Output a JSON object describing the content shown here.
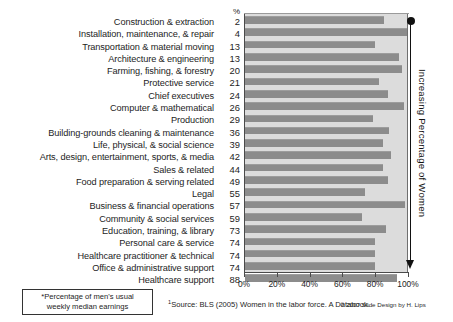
{
  "chart_data": {
    "type": "bar",
    "orientation": "horizontal",
    "title": "",
    "xlabel": "",
    "ylabel": "",
    "xlim": [
      0,
      100
    ],
    "grid": false,
    "legend": null,
    "pct_column_header": "%",
    "categories": [
      "Construction & extraction",
      "Installation, maintenance, & repair",
      "Transportation & material moving",
      "Architecture & engineering",
      "Farming, fishing, & forestry",
      "Protective service",
      "Chief executives",
      "Computer & mathematical",
      "Production",
      "Building-grounds cleaning & maintenance",
      "Life, physical, & social science",
      "Arts, design, entertainment, sports, & media",
      "Sales & related",
      "Food preparation & serving related",
      "Legal",
      "Business & financial operations",
      "Community & social services",
      "Education, training, & library",
      "Personal care & service",
      "Healthcare practitioner & technical",
      "Office & administrative support",
      "Healthcare support"
    ],
    "percent_women": [
      2,
      4,
      13,
      13,
      20,
      21,
      24,
      26,
      29,
      36,
      39,
      42,
      44,
      49,
      55,
      57,
      59,
      73,
      74,
      74,
      74,
      88
    ],
    "values": [
      86,
      100,
      80,
      95,
      97,
      83,
      88,
      98,
      79,
      89,
      85,
      90,
      85,
      88,
      74,
      99,
      72,
      87,
      80,
      80,
      80,
      94
    ],
    "xticks": [
      0,
      20,
      40,
      60,
      80,
      100
    ],
    "xticklabels": [
      "0%",
      "20%",
      "40%",
      "60%",
      "80%",
      "100%"
    ]
  },
  "annotation": {
    "axis_arrow_label": "Increasing Percentage of Women"
  },
  "footnotes": {
    "note_line1": "*Percentage of men's usual",
    "note_line2": "weekly median earnings",
    "source_marker": "1",
    "source_text": "Source: BLS (2005) Women in the labor force. A Databook.",
    "credit": "© 2007 Slide Design by H. Lips"
  },
  "colors": {
    "bar": "#8c8c8c",
    "plot_background": "#dcdcdc",
    "text": "#1d1d1d",
    "arrow": "#111111"
  }
}
